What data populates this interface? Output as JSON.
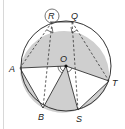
{
  "diagram": {
    "type": "circle-geometry",
    "colors": {
      "shade": "#cfcfcf",
      "line": "#333333",
      "background": "#ffffff",
      "rule": "#d8d8d8"
    },
    "labels": {
      "R": "R",
      "Q": "Q",
      "O": "O",
      "A": "A",
      "T": "T",
      "B": "B",
      "S": "S"
    },
    "points": {
      "O": [
        66,
        66
      ],
      "R": [
        52,
        22
      ],
      "Q": [
        72,
        22
      ],
      "A": [
        20,
        68
      ],
      "T": [
        109,
        81
      ],
      "B": [
        43,
        108
      ],
      "S": [
        78,
        110
      ]
    }
  }
}
